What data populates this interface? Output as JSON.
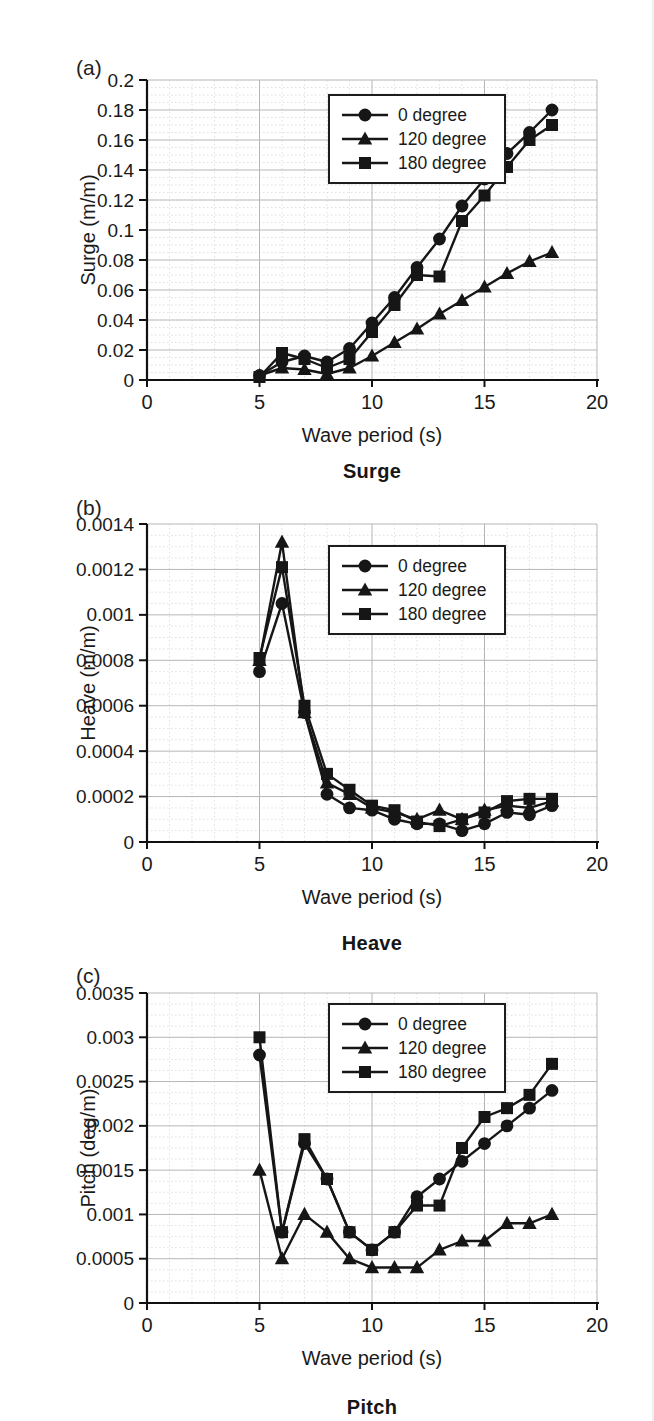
{
  "page": {
    "background": "#ffffff",
    "figure_panels": [
      "(a)",
      "(b)",
      "(c)"
    ]
  },
  "colors": {
    "line": "#161616",
    "text": "#1a1a1a",
    "grid_major": "#b6b6b6",
    "grid_minor": "#dcdcdc",
    "axis": "#111111",
    "legend_border": "#1d1d1d",
    "background": "#ffffff"
  },
  "chart_data": [
    {
      "id": "surge",
      "type": "line",
      "panel_label": "(a)",
      "caption": "Surge",
      "xlabel": "Wave period (s)",
      "ylabel": "Surge (m/m)",
      "xlim": [
        0,
        20
      ],
      "ylim": [
        0,
        0.2
      ],
      "grid": true,
      "legend_position": "top-center-inside",
      "xticks": [
        0,
        5,
        10,
        15,
        20
      ],
      "yticks": [
        0,
        0.02,
        0.04,
        0.06,
        0.08,
        0.1,
        0.12,
        0.14,
        0.16,
        0.18,
        0.2
      ],
      "ytick_labels": [
        "0",
        "0.02",
        "0.04",
        "0.06",
        "0.08",
        "0.1",
        "0.12",
        "0.14",
        "0.16",
        "0.18",
        "0.2"
      ],
      "x": [
        5,
        6,
        7,
        8,
        9,
        10,
        11,
        12,
        13,
        14,
        15,
        16,
        17,
        18
      ],
      "series": [
        {
          "name": "0 degree",
          "marker": "circle",
          "values": [
            0.003,
            0.012,
            0.016,
            0.012,
            0.021,
            0.038,
            0.055,
            0.075,
            0.094,
            0.116,
            0.134,
            0.151,
            0.165,
            0.18
          ]
        },
        {
          "name": "120 degree",
          "marker": "triangle",
          "values": [
            0.003,
            0.008,
            0.007,
            0.004,
            0.008,
            0.016,
            0.025,
            0.034,
            0.044,
            0.053,
            0.062,
            0.071,
            0.079,
            0.085
          ]
        },
        {
          "name": "180 degree",
          "marker": "square",
          "values": [
            0.002,
            0.018,
            0.014,
            0.008,
            0.014,
            0.032,
            0.05,
            0.07,
            0.069,
            0.106,
            0.123,
            0.142,
            0.16,
            0.17
          ]
        }
      ]
    },
    {
      "id": "heave",
      "type": "line",
      "panel_label": "(b)",
      "caption": "Heave",
      "xlabel": "Wave period (s)",
      "ylabel": "Heave (m/m)",
      "xlim": [
        0,
        20
      ],
      "ylim": [
        0,
        0.0014
      ],
      "grid": true,
      "legend_position": "top-center-inside",
      "xticks": [
        0,
        5,
        10,
        15,
        20
      ],
      "yticks": [
        0,
        0.0002,
        0.0004,
        0.0006,
        0.0008,
        0.001,
        0.0012,
        0.0014
      ],
      "ytick_labels": [
        "0",
        "0.0002",
        "0.0004",
        "0.0006",
        "0.0008",
        "0.001",
        "0.0012",
        "0.0014"
      ],
      "x": [
        5,
        6,
        7,
        8,
        9,
        10,
        11,
        12,
        13,
        14,
        15,
        16,
        17,
        18
      ],
      "series": [
        {
          "name": "0 degree",
          "marker": "circle",
          "values": [
            0.00075,
            0.00105,
            0.00057,
            0.00021,
            0.00015,
            0.00014,
            0.0001,
            8e-05,
            8e-05,
            5e-05,
            8e-05,
            0.00013,
            0.00012,
            0.00016
          ]
        },
        {
          "name": "120 degree",
          "marker": "triangle",
          "values": [
            0.0008,
            0.00132,
            0.00057,
            0.00026,
            0.00021,
            0.00015,
            0.00013,
            0.0001,
            0.00014,
            0.0001,
            0.00014,
            0.00016,
            0.00015,
            0.00018
          ]
        },
        {
          "name": "180 degree",
          "marker": "square",
          "values": [
            0.00081,
            0.00121,
            0.0006,
            0.0003,
            0.00023,
            0.00016,
            0.00014,
            9e-05,
            7e-05,
            0.0001,
            0.00013,
            0.00018,
            0.00019,
            0.00019
          ]
        }
      ]
    },
    {
      "id": "pitch",
      "type": "line",
      "panel_label": "(c)",
      "caption": "Pitch",
      "xlabel": "Wave period (s)",
      "ylabel": "Pitch (deg/m)",
      "xlim": [
        0,
        20
      ],
      "ylim": [
        0,
        0.0035
      ],
      "grid": true,
      "legend_position": "top-center-inside",
      "xticks": [
        0,
        5,
        10,
        15,
        20
      ],
      "yticks": [
        0,
        0.0005,
        0.001,
        0.0015,
        0.002,
        0.0025,
        0.003,
        0.0035
      ],
      "ytick_labels": [
        "0",
        "0.0005",
        "0.001",
        "0.0015",
        "0.002",
        "0.0025",
        "0.003",
        "0.0035"
      ],
      "x": [
        5,
        6,
        7,
        8,
        9,
        10,
        11,
        12,
        13,
        14,
        15,
        16,
        17,
        18
      ],
      "series": [
        {
          "name": "0 degree",
          "marker": "circle",
          "values": [
            0.0028,
            0.0008,
            0.0018,
            0.0014,
            0.0008,
            0.0006,
            0.0008,
            0.0012,
            0.0014,
            0.0016,
            0.0018,
            0.002,
            0.0022,
            0.0024
          ]
        },
        {
          "name": "120 degree",
          "marker": "triangle",
          "values": [
            0.0015,
            0.0005,
            0.001,
            0.0008,
            0.0005,
            0.0004,
            0.0004,
            0.0004,
            0.0006,
            0.0007,
            0.0007,
            0.0009,
            0.0009,
            0.001
          ]
        },
        {
          "name": "180 degree",
          "marker": "square",
          "values": [
            0.003,
            0.0008,
            0.00185,
            0.0014,
            0.0008,
            0.0006,
            0.0008,
            0.0011,
            0.0011,
            0.00175,
            0.0021,
            0.0022,
            0.00235,
            0.0027
          ]
        }
      ]
    }
  ]
}
